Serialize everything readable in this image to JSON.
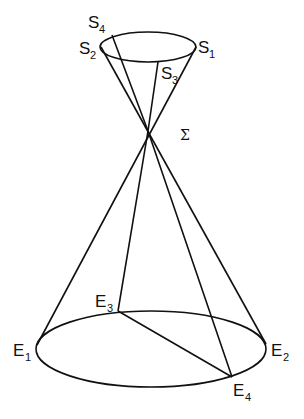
{
  "diagram": {
    "apex_label": "Σ",
    "top_ellipse": {
      "cx": 148,
      "cy": 47,
      "rx": 48,
      "ry": 15
    },
    "bottom_ellipse": {
      "cx": 151,
      "cy": 349,
      "rx": 115,
      "ry": 38
    },
    "apex": {
      "x": 148,
      "y": 131
    },
    "top_points": [
      {
        "name": "S",
        "sub": "1",
        "x": 196,
        "y": 47
      },
      {
        "name": "S",
        "sub": "2",
        "x": 101,
        "y": 47
      },
      {
        "name": "S",
        "sub": "3",
        "x": 158,
        "y": 62
      },
      {
        "name": "S",
        "sub": "4",
        "x": 112,
        "y": 35
      }
    ],
    "bottom_points": [
      {
        "name": "E",
        "sub": "1",
        "x": 37,
        "y": 345
      },
      {
        "name": "E",
        "sub": "2",
        "x": 266,
        "y": 344
      },
      {
        "name": "E",
        "sub": "3",
        "x": 118,
        "y": 311
      },
      {
        "name": "E",
        "sub": "4",
        "x": 232,
        "y": 377
      }
    ],
    "labels": {
      "s1": {
        "main": "S",
        "sub": "1"
      },
      "s2": {
        "main": "S",
        "sub": "2"
      },
      "s3": {
        "main": "S",
        "sub": "3"
      },
      "s4": {
        "main": "S",
        "sub": "4"
      },
      "e1": {
        "main": "E",
        "sub": "1"
      },
      "e2": {
        "main": "E",
        "sub": "2"
      },
      "e3": {
        "main": "E",
        "sub": "3"
      },
      "e4": {
        "main": "E",
        "sub": "4"
      }
    }
  }
}
